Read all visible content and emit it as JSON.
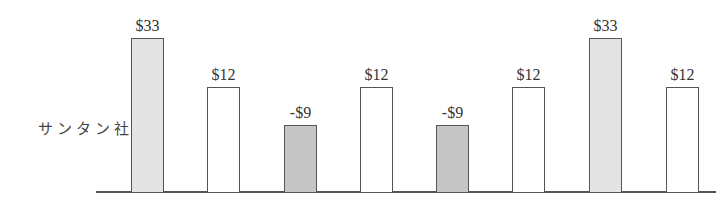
{
  "chart_data": {
    "type": "bar",
    "title": "",
    "xlabel": "",
    "ylabel": "サンタン社",
    "row_label": "サンタン社",
    "categories": [
      "1",
      "2",
      "3",
      "4",
      "5",
      "6",
      "7",
      "8"
    ],
    "values": [
      33,
      12,
      -9,
      12,
      -9,
      12,
      33,
      12
    ],
    "value_labels": [
      "$33",
      "$12",
      "-$9",
      "$12",
      "-$9",
      "$12",
      "$33",
      "$12"
    ],
    "fills": [
      "light",
      "none",
      "dark",
      "none",
      "dark",
      "none",
      "light",
      "none"
    ],
    "grid": false,
    "legend": null,
    "colors": {
      "light_fill": "#e4e4e4",
      "dark_fill": "#c6c6c6",
      "outline": "#555555"
    }
  },
  "bars": [
    {
      "label": "$33",
      "x": 131,
      "top": 38,
      "fill": "light"
    },
    {
      "label": "$12",
      "x": 207,
      "top": 87,
      "fill": "none"
    },
    {
      "label": "-$9",
      "x": 284,
      "top": 125,
      "fill": "dark"
    },
    {
      "label": "$12",
      "x": 360,
      "top": 87,
      "fill": "none"
    },
    {
      "label": "-$9",
      "x": 436,
      "top": 125,
      "fill": "dark"
    },
    {
      "label": "$12",
      "x": 512,
      "top": 87,
      "fill": "none"
    },
    {
      "label": "$33",
      "x": 589,
      "top": 38,
      "fill": "light"
    },
    {
      "label": "$12",
      "x": 666,
      "top": 87,
      "fill": "none"
    }
  ]
}
